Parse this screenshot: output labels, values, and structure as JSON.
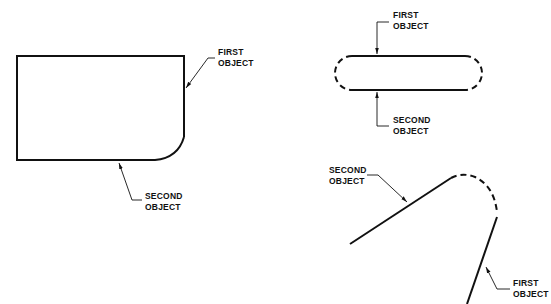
{
  "figures": [
    {
      "id": "fillet-rectangle",
      "labels": [
        {
          "line1": "FIRST",
          "line2": "OBJECT"
        },
        {
          "line1": "SECOND",
          "line2": "OBJECT"
        }
      ]
    },
    {
      "id": "slot-dashed-ends",
      "labels": [
        {
          "line1": "FIRST",
          "line2": "OBJECT"
        },
        {
          "line1": "SECOND",
          "line2": "OBJECT"
        }
      ]
    },
    {
      "id": "angled-lines-dashed-arc",
      "labels": [
        {
          "line1": "SECOND",
          "line2": "OBJECT"
        },
        {
          "line1": "FIRST",
          "line2": "OBJECT"
        }
      ]
    }
  ],
  "colors": {
    "stroke": "#111111",
    "background": "#ffffff"
  }
}
